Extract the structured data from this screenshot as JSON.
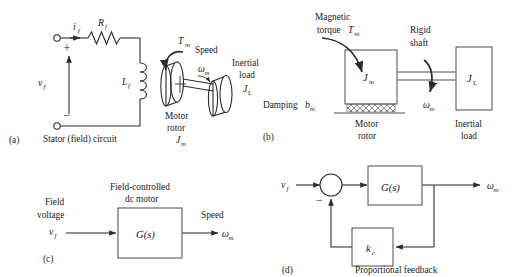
{
  "figure": {
    "title_implicit": "Field-controlled dc motor: schematic, mechanical model, and block diagrams",
    "panels": {
      "a": {
        "tag": "(a)",
        "caption": "Stator (field) circuit",
        "labels": {
          "current": "i",
          "current_sub": "f",
          "resistor": "R",
          "resistor_sub": "f",
          "voltage": "v",
          "voltage_sub": "f",
          "plus": "+",
          "minus": "−",
          "inductor": "L",
          "inductor_sub": "f",
          "torque": "T",
          "torque_sub": "m",
          "speed_word": "Speed",
          "omega": "ω",
          "omega_sub": "m",
          "motor_rotor_line1": "Motor",
          "motor_rotor_line2": "rotor",
          "motor_inertia": "J",
          "motor_inertia_sub": "m",
          "inertial_load_line1": "Inertial",
          "inertial_load_line2": "load",
          "load_inertia": "J",
          "load_inertia_sub": "L"
        }
      },
      "b": {
        "tag": "(b)",
        "labels": {
          "magnetic_line1": "Magnetic",
          "magnetic_line2": "torque",
          "magnetic_torque_sym": "T",
          "magnetic_torque_sub": "m",
          "rigid_line1": "Rigid",
          "rigid_line2": "shaft",
          "damping_word": "Damping",
          "damping_sym": "b",
          "damping_sub": "m",
          "motor_inertia": "J",
          "motor_inertia_sub": "m",
          "load_inertia": "J",
          "load_inertia_sub": "L",
          "omega": "ω",
          "omega_sub": "m",
          "motor_rotor_line1": "Motor",
          "motor_rotor_line2": "rotor",
          "inertial_load_line1": "Inertial",
          "inertial_load_line2": "load"
        }
      },
      "c": {
        "tag": "(c)",
        "labels": {
          "block_title_line1": "Field-controlled",
          "block_title_line2": "dc motor",
          "input_line1": "Field",
          "input_line2": "voltage",
          "input_sym": "v",
          "input_sub": "f",
          "transfer": "G(s)",
          "output_word": "Speed",
          "output_sym": "ω",
          "output_sub": "m"
        }
      },
      "d": {
        "tag": "(d)",
        "caption": "Proportional feedback",
        "labels": {
          "input_sym": "v",
          "input_sub": "f",
          "sum_minus": "−",
          "forward_block": "G(s)",
          "feedback_block": "k",
          "feedback_block_sub": "c",
          "output_sym": "ω",
          "output_sub": "m"
        }
      }
    },
    "colors": {
      "ink": "#2b2b2b",
      "box_stroke": "#4a4a4a",
      "shaft_gray": "#8a8a8a",
      "background": "#ffffff"
    }
  }
}
